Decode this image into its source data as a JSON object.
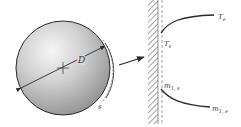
{
  "diagram": {
    "title": "",
    "colors": {
      "line": "#2a2a2a",
      "sphere_light": "#f4f4f4",
      "sphere_mid": "#c8c8c8",
      "sphere_dark": "#8e8e8e",
      "hatch": "#555555",
      "dashed": "#777777",
      "text": "#333333"
    },
    "sphere": {
      "diameter_label": "D",
      "surface_label": "s"
    },
    "wall_detail": {
      "temperature_profile": {
        "surface_label": "T",
        "surface_sub": "s",
        "edge_label": "T",
        "edge_sub": "e"
      },
      "concentration_profile": {
        "surface_label": "m",
        "surface_sub": "1, s",
        "edge_label": "m",
        "edge_sub": "1, e"
      }
    }
  }
}
